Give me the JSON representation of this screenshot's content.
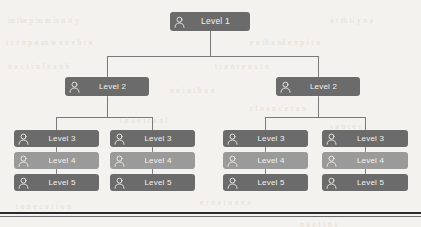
{
  "diagram": {
    "type": "organizational-hierarchy-tree",
    "background_color": "#f4f2ee",
    "node_color": "#6b6b6b",
    "node_color_light": "#9a9a9a",
    "label_color": "#f2f1ee",
    "connector_color": "#7a7a7a",
    "rule_color": "#2b2b2b",
    "icon_name": "user-icon",
    "levels": [
      {
        "label": "Level 1",
        "count": 1
      },
      {
        "label": "Level 2",
        "count": 2
      },
      {
        "label": "Level 3",
        "count": 4
      },
      {
        "label": "Level 4",
        "count": 4
      },
      {
        "label": "Level 5",
        "count": 4
      }
    ],
    "nodes": [
      {
        "id": "l1",
        "label": "Level 1",
        "x": 170,
        "y": 12,
        "w": 80,
        "h": 19,
        "shade": "dark"
      },
      {
        "id": "l2a",
        "label": "Level 2",
        "x": 65,
        "y": 77,
        "w": 84,
        "h": 19,
        "shade": "dark"
      },
      {
        "id": "l2b",
        "label": "Level 2",
        "x": 276,
        "y": 77,
        "w": 84,
        "h": 19,
        "shade": "dark"
      },
      {
        "id": "l3a",
        "label": "Level 3",
        "x": 14,
        "y": 130,
        "w": 85,
        "h": 17,
        "shade": "dark"
      },
      {
        "id": "l4a",
        "label": "Level 4",
        "x": 14,
        "y": 152,
        "w": 85,
        "h": 17,
        "shade": "light"
      },
      {
        "id": "l5a",
        "label": "Level 5",
        "x": 14,
        "y": 174,
        "w": 85,
        "h": 17,
        "shade": "dark"
      },
      {
        "id": "l3b",
        "label": "Level 3",
        "x": 110,
        "y": 130,
        "w": 85,
        "h": 17,
        "shade": "dark"
      },
      {
        "id": "l4b",
        "label": "Level 4",
        "x": 110,
        "y": 152,
        "w": 85,
        "h": 17,
        "shade": "light"
      },
      {
        "id": "l5b",
        "label": "Level 5",
        "x": 110,
        "y": 174,
        "w": 85,
        "h": 17,
        "shade": "dark"
      },
      {
        "id": "l3c",
        "label": "Level 3",
        "x": 223,
        "y": 130,
        "w": 85,
        "h": 17,
        "shade": "dark"
      },
      {
        "id": "l4c",
        "label": "Level 4",
        "x": 223,
        "y": 152,
        "w": 85,
        "h": 17,
        "shade": "light"
      },
      {
        "id": "l5c",
        "label": "Level 5",
        "x": 223,
        "y": 174,
        "w": 85,
        "h": 17,
        "shade": "dark"
      },
      {
        "id": "l3d",
        "label": "Level 3",
        "x": 322,
        "y": 130,
        "w": 86,
        "h": 17,
        "shade": "dark"
      },
      {
        "id": "l4d",
        "label": "Level 4",
        "x": 322,
        "y": 152,
        "w": 86,
        "h": 17,
        "shade": "light"
      },
      {
        "id": "l5d",
        "label": "Level 5",
        "x": 322,
        "y": 174,
        "w": 86,
        "h": 17,
        "shade": "dark"
      }
    ],
    "bottom_rule_y": 212
  },
  "background_text": [
    {
      "t": "in the p  in  m   is  n   it   y",
      "x": 8,
      "y": 16
    },
    {
      "t": "t   n  the  i   n    ic  of  the  rs",
      "x": 170,
      "y": 16
    },
    {
      "t": "a   t    th  ti    y    n     a",
      "x": 330,
      "y": 16
    },
    {
      "t": "t   c   r   n  p   a    an  w   a   n  e   h   t   a",
      "x": 6,
      "y": 38
    },
    {
      "t": "e  n  th  a   nd  e   n  p  i   t   a",
      "x": 250,
      "y": 38
    },
    {
      "t": "n   a  c    t   i    n  l    e  a   n   h",
      "x": 8,
      "y": 62
    },
    {
      "t": "t   i   a   n    r     e  n   s   t  n",
      "x": 215,
      "y": 62
    },
    {
      "t": "n   e   i    a   t  h   o   n",
      "x": 170,
      "y": 86
    },
    {
      "t": "r   l   o  a  n   c    e   r   a   n",
      "x": 250,
      "y": 104
    },
    {
      "t": "t   n  a   e   i   r   a   n   l",
      "x": 120,
      "y": 116
    },
    {
      "t": "s   a   n    t   e    r   i",
      "x": 330,
      "y": 122
    },
    {
      "t": "e   r   n    a  t  o   n   e   a",
      "x": 200,
      "y": 198
    },
    {
      "t": "t   a   n   e    c   a  t  i   o   n",
      "x": 16,
      "y": 202
    },
    {
      "t": "n   a   e    t   i   n  s",
      "x": 300,
      "y": 220
    }
  ]
}
